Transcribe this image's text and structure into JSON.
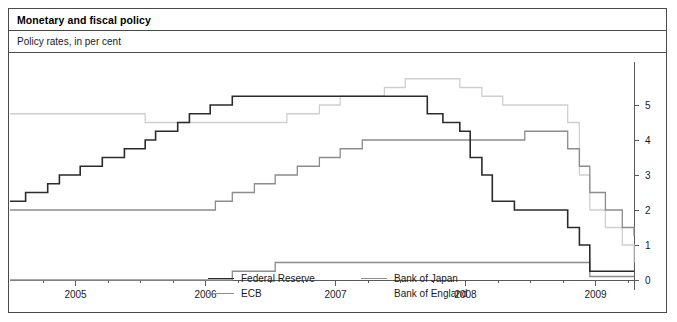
{
  "panel": {
    "title": "Monetary and fiscal policy",
    "subtitle": "Policy rates, in per cent"
  },
  "legend": {
    "items": [
      {
        "label": "Federal Reserve",
        "color": "#2b2b2b",
        "column": 1
      },
      {
        "label": "ECB",
        "color": "#8c8c8c",
        "column": 1
      },
      {
        "label": "Bank of Japan",
        "color": "#8c8c8c",
        "column": 2
      },
      {
        "label": "Bank of England",
        "color": "#ffffff",
        "column": 2
      }
    ]
  },
  "chart_data": {
    "type": "line",
    "title": "Monetary and fiscal policy",
    "subtitle": "Policy rates, in per cent",
    "xlabel": "",
    "ylabel": "",
    "ylim": [
      0,
      5.6
    ],
    "xlim": [
      2004.5,
      2009.3
    ],
    "grid": false,
    "legend_position": "bottom",
    "y_axis_side": "right",
    "yticks": [
      0,
      1,
      2,
      3,
      4,
      5
    ],
    "ytick_labels": [
      "0",
      "1",
      "2",
      "3",
      "4",
      "5"
    ],
    "xticks": [
      2005,
      2006,
      2007,
      2008,
      2009
    ],
    "xtick_labels": [
      "2005",
      "2006",
      "2007",
      "2008",
      "2009"
    ],
    "x_minor_ticks": [
      2004.75,
      2005.25,
      2005.5,
      2005.75,
      2006.25,
      2006.5,
      2006.75,
      2007.25,
      2007.5,
      2007.75,
      2008.25,
      2008.5,
      2008.75,
      2009.25
    ],
    "interpolation": "step-after",
    "series": [
      {
        "name": "Federal Reserve",
        "color": "#2b2b2b",
        "x": [
          2004.5,
          2004.62,
          2004.79,
          2004.88,
          2005.04,
          2005.21,
          2005.38,
          2005.54,
          2005.62,
          2005.79,
          2005.88,
          2006.04,
          2006.21,
          2006.33,
          2006.46,
          2007.71,
          2007.83,
          2007.96,
          2008.04,
          2008.13,
          2008.21,
          2008.38,
          2008.79,
          2008.88,
          2008.96,
          2009.3
        ],
        "y": [
          2.25,
          2.5,
          2.75,
          3.0,
          3.25,
          3.5,
          3.75,
          4.0,
          4.25,
          4.5,
          4.75,
          5.0,
          5.25,
          5.25,
          5.25,
          4.75,
          4.5,
          4.25,
          3.5,
          3.0,
          2.25,
          2.0,
          1.5,
          1.0,
          0.25,
          0.25
        ]
      },
      {
        "name": "ECB",
        "color": "#8c8c8c",
        "x": [
          2004.5,
          2005.92,
          2006.08,
          2006.21,
          2006.38,
          2006.54,
          2006.71,
          2006.88,
          2007.04,
          2007.21,
          2007.38,
          2007.54,
          2008.46,
          2008.62,
          2008.79,
          2008.88,
          2008.96,
          2009.08,
          2009.21,
          2009.3
        ],
        "y": [
          2.0,
          2.0,
          2.25,
          2.5,
          2.75,
          3.0,
          3.25,
          3.5,
          3.75,
          4.0,
          4.0,
          4.0,
          4.25,
          4.25,
          3.75,
          3.25,
          2.5,
          2.0,
          1.5,
          1.25
        ]
      },
      {
        "name": "Bank of Japan",
        "color": "#8c8c8c",
        "x": [
          2004.5,
          2006.13,
          2006.21,
          2006.54,
          2008.79,
          2008.96,
          2009.3
        ],
        "y": [
          0.0,
          0.0,
          0.25,
          0.5,
          0.5,
          0.1,
          0.1
        ]
      },
      {
        "name": "Bank of England",
        "color": "#ffffff",
        "x": [
          2004.5,
          2005.54,
          2006.63,
          2006.88,
          2007.04,
          2007.38,
          2007.54,
          2007.96,
          2008.13,
          2008.29,
          2008.79,
          2008.88,
          2008.96,
          2009.08,
          2009.21,
          2009.3
        ],
        "y": [
          4.75,
          4.5,
          4.75,
          5.0,
          5.25,
          5.5,
          5.75,
          5.5,
          5.25,
          5.0,
          4.5,
          3.0,
          2.0,
          1.5,
          1.0,
          0.5
        ]
      }
    ]
  }
}
